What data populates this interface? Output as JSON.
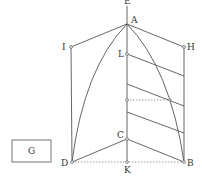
{
  "diagram": {
    "labels": {
      "E": "E",
      "A": "A",
      "I": "I",
      "H": "H",
      "L": "L",
      "C": "C",
      "D": "D",
      "K": "K",
      "B": "B",
      "G": "G"
    },
    "points": {
      "E": [
        127,
        8
      ],
      "A": [
        127,
        24
      ],
      "I": [
        71,
        47
      ],
      "H": [
        184,
        47
      ],
      "L": [
        127,
        54
      ],
      "O": [
        127,
        100
      ],
      "C": [
        127,
        139
      ],
      "D": [
        72,
        162
      ],
      "K": [
        127,
        162
      ],
      "B": [
        184,
        162
      ]
    },
    "box_G": {
      "x": 12,
      "y": 140,
      "w": 39,
      "h": 22
    },
    "colors": {
      "line": "#555555",
      "dotted": "#888888",
      "text": "#333333"
    }
  }
}
